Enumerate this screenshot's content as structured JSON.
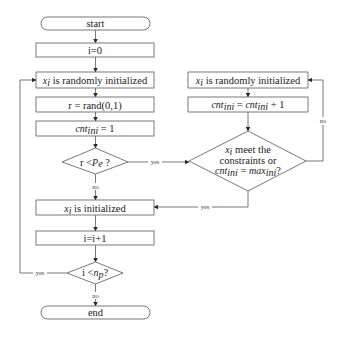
{
  "flowchart": {
    "left": {
      "start": "start",
      "init_i": "i=0",
      "random_init_var": "x",
      "random_init_sub": "i",
      "random_init_text": " is randomly initialized",
      "rand": "r = rand(0,1)",
      "cnt_var": "cnt",
      "cnt_sub": "ini",
      "cnt_rest": " = 1",
      "cond1_prefix": "r <",
      "cond1_var": "P",
      "cond1_sub": "e",
      "cond1_suffix": " ?",
      "initialized_var": "x",
      "initialized_sub": "i",
      "initialized_text": " is initialized",
      "increment": "i=i+1",
      "cond2_prefix": "i <",
      "cond2_var": "n",
      "cond2_sub": "p",
      "cond2_suffix": "?",
      "end": "end"
    },
    "right": {
      "random_init_var": "x",
      "random_init_sub": "i",
      "random_init_text": " is randomly initialized",
      "cnt_inc_lhs": "cnt",
      "cnt_inc_lhs_sub": "ini",
      "cnt_inc_mid": " = ",
      "cnt_inc_rhs": "cnt",
      "cnt_inc_rhs_sub": "ini",
      "cnt_inc_tail": " + 1",
      "cond_line1_var": "x",
      "cond_line1_sub": "i",
      "cond_line1_text": " meet the",
      "cond_line2": "constraints or",
      "cond_line3_lhs": "cnt",
      "cond_line3_lhs_sub": "ini",
      "cond_line3_mid": " = ",
      "cond_line3_rhs": "max",
      "cond_line3_rhs_sub": "ini",
      "cond_line3_tail": "?"
    },
    "edge_labels": {
      "cond1_yes": "yes",
      "cond1_no": "no",
      "cond2_yes": "yes",
      "cond2_no": "no",
      "cond3_yes": "yes",
      "cond3_no": "no"
    }
  }
}
